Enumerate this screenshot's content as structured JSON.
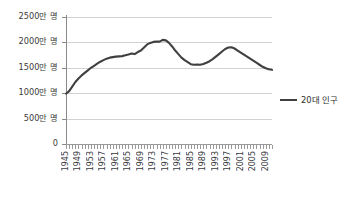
{
  "chart_data": {
    "type": "line",
    "title": "",
    "xlabel": "",
    "ylabel": "",
    "grid": true,
    "legend_position": "right",
    "ylim": [
      0,
      25000000
    ],
    "xlim": [
      1945,
      2011
    ],
    "y_ticks": [
      0,
      5000000,
      10000000,
      15000000,
      20000000,
      25000000
    ],
    "y_tick_labels": [
      "0",
      "500만 명",
      "1000만 명",
      "1500만 명",
      "2000만 명",
      "2500만 명"
    ],
    "x_tick_labels": [
      "1945",
      "1949",
      "1953",
      "1957",
      "1961",
      "1965",
      "1969",
      "1973",
      "1977",
      "1981",
      "1985",
      "1989",
      "1993",
      "1997",
      "2001",
      "2005",
      "2009"
    ],
    "x_tick_step": 4,
    "x_minor_tick_step": 1,
    "series": [
      {
        "name": "20대 인구",
        "color": "#404040",
        "x": [
          1945,
          1946,
          1947,
          1948,
          1949,
          1950,
          1951,
          1952,
          1953,
          1954,
          1955,
          1956,
          1957,
          1958,
          1959,
          1960,
          1961,
          1962,
          1963,
          1964,
          1965,
          1966,
          1967,
          1968,
          1969,
          1970,
          1971,
          1972,
          1973,
          1974,
          1975,
          1976,
          1977,
          1978,
          1979,
          1980,
          1981,
          1982,
          1983,
          1984,
          1985,
          1986,
          1987,
          1988,
          1989,
          1990,
          1991,
          1992,
          1993,
          1994,
          1995,
          1996,
          1997,
          1998,
          1999,
          2000,
          2001,
          2002,
          2003,
          2004,
          2005,
          2006,
          2007,
          2008,
          2009,
          2010,
          2011
        ],
        "values": [
          9900000,
          10400000,
          11300000,
          12200000,
          12900000,
          13500000,
          14000000,
          14500000,
          15000000,
          15400000,
          15800000,
          16200000,
          16500000,
          16800000,
          17000000,
          17100000,
          17200000,
          17250000,
          17300000,
          17450000,
          17600000,
          17800000,
          17700000,
          18100000,
          18400000,
          19000000,
          19600000,
          19900000,
          20100000,
          20150000,
          20150000,
          20500000,
          20400000,
          19900000,
          19200000,
          18400000,
          17700000,
          17000000,
          16500000,
          16100000,
          15700000,
          15600000,
          15650000,
          15600000,
          15750000,
          16000000,
          16300000,
          16700000,
          17200000,
          17700000,
          18200000,
          18700000,
          19000000,
          19050000,
          18800000,
          18400000,
          18000000,
          17600000,
          17200000,
          16800000,
          16400000,
          16000000,
          15600000,
          15200000,
          14900000,
          14700000,
          14600000
        ]
      }
    ]
  },
  "legend": {
    "label": "20대 인구"
  }
}
